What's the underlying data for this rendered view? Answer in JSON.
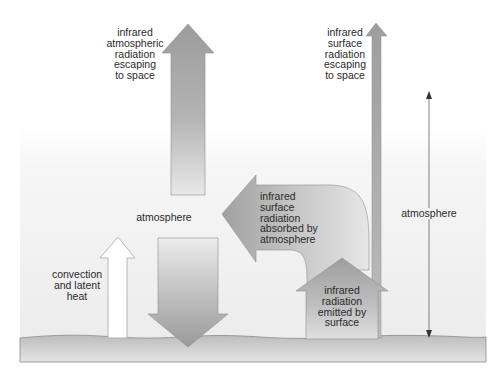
{
  "diagram": {
    "type": "greenhouse-energy-flow",
    "labels": {
      "atm_escape": "infrared\natmospheric\nradiation\nescaping\nto space",
      "surface_escape": "infrared\nsurface\nradiation\nescaping\nto space",
      "atmosphere_center": "atmosphere",
      "absorbed": "infrared\nsurface\nradiation\nabsorbed by\natmosphere",
      "atmosphere_scale": "atmosphere",
      "convection": "convection\nand latent\nheat",
      "emitted": "infrared\nradiation\nemitted by\nsurface"
    },
    "colors": {
      "arrow_dark": "#9a9a9a",
      "arrow_light": "#e2e2e2",
      "arrow_outline": "#8a8a8a",
      "atmosphere_bg": "#efefef",
      "ground_top": "#b8b8b8",
      "ground_bottom": "#dedede",
      "scale_line": "#555555",
      "convection_arrow": "#ffffff"
    }
  }
}
